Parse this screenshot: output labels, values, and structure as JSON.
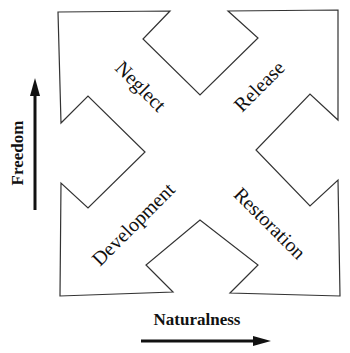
{
  "diagram": {
    "type": "four-quadrant arrow diagram",
    "colors": {
      "outline": "#333333",
      "text": "#111111",
      "axis_arrow": "#111111",
      "background": "#ffffff"
    },
    "quadrants": [
      {
        "position": "top-left",
        "label": "Neglect",
        "arrow_direction": "up-left"
      },
      {
        "position": "top-right",
        "label": "Release",
        "arrow_direction": "up-right"
      },
      {
        "position": "bottom-left",
        "label": "Development",
        "arrow_direction": "down-left"
      },
      {
        "position": "bottom-right",
        "label": "Restoration",
        "arrow_direction": "down-right"
      }
    ],
    "axes": {
      "vertical": {
        "label": "Freedom",
        "direction": "up"
      },
      "horizontal": {
        "label": "Naturalness",
        "direction": "right"
      }
    }
  }
}
